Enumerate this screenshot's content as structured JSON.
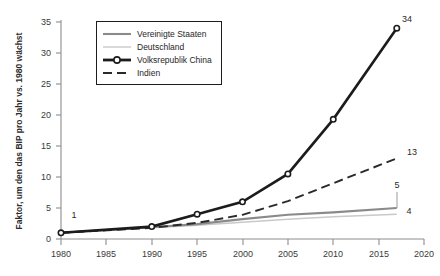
{
  "chart_data": {
    "type": "line",
    "title": "",
    "subtitle": "",
    "xlabel": "",
    "ylabel": "Faktor, um den das BIP pro Jahr vs. 1980 wächst",
    "xlim": [
      1980,
      2020
    ],
    "ylim": [
      0,
      35
    ],
    "xticks": [
      "1980",
      "1985",
      "1990",
      "1995",
      "2000",
      "2005",
      "2010",
      "2015",
      "2020"
    ],
    "yticks": [
      "0",
      "5",
      "10",
      "15",
      "20",
      "25",
      "30",
      "35"
    ],
    "grid": false,
    "legend_position": "top-center",
    "x": [
      1980,
      1990,
      1995,
      2000,
      2005,
      2010,
      2017
    ],
    "series": [
      {
        "name": "Vereinigte Staaten",
        "style": "solid",
        "color": "#8a8a8a",
        "marker": "none",
        "values": [
          1,
          1.9,
          2.4,
          3.2,
          3.9,
          4.3,
          5
        ]
      },
      {
        "name": "Deutschland",
        "style": "solid-thin",
        "color": "#c9c9c9",
        "marker": "none",
        "values": [
          1,
          1.8,
          2.2,
          2.7,
          3.2,
          3.6,
          4
        ]
      },
      {
        "name": "Volksrepublik China",
        "style": "solid-marker",
        "color": "#1c1c1c",
        "marker": "circle",
        "values": [
          1,
          2,
          4,
          6,
          10.5,
          19.3,
          34
        ]
      },
      {
        "name": "Indien",
        "style": "dashed",
        "color": "#2a2a2a",
        "marker": "none",
        "values": [
          1,
          1.8,
          2.6,
          3.9,
          6.1,
          9.0,
          13
        ]
      }
    ],
    "annotations": [
      {
        "text": "1",
        "x": 1980,
        "y": 1,
        "series": "Volksrepublik China"
      },
      {
        "text": "34",
        "x": 2017,
        "y": 34,
        "series": "Volksrepublik China"
      },
      {
        "text": "13",
        "x": 2017,
        "y": 13,
        "series": "Indien"
      },
      {
        "text": "5",
        "x": 2017,
        "y": 5,
        "series": "Vereinigte Staaten"
      },
      {
        "text": "4",
        "x": 2017,
        "y": 4,
        "series": "Deutschland"
      }
    ]
  },
  "legend": {
    "items": [
      {
        "label": "Vereinigte Staaten"
      },
      {
        "label": "Deutschland"
      },
      {
        "label": "Volksrepublik China"
      },
      {
        "label": "Indien"
      }
    ]
  }
}
